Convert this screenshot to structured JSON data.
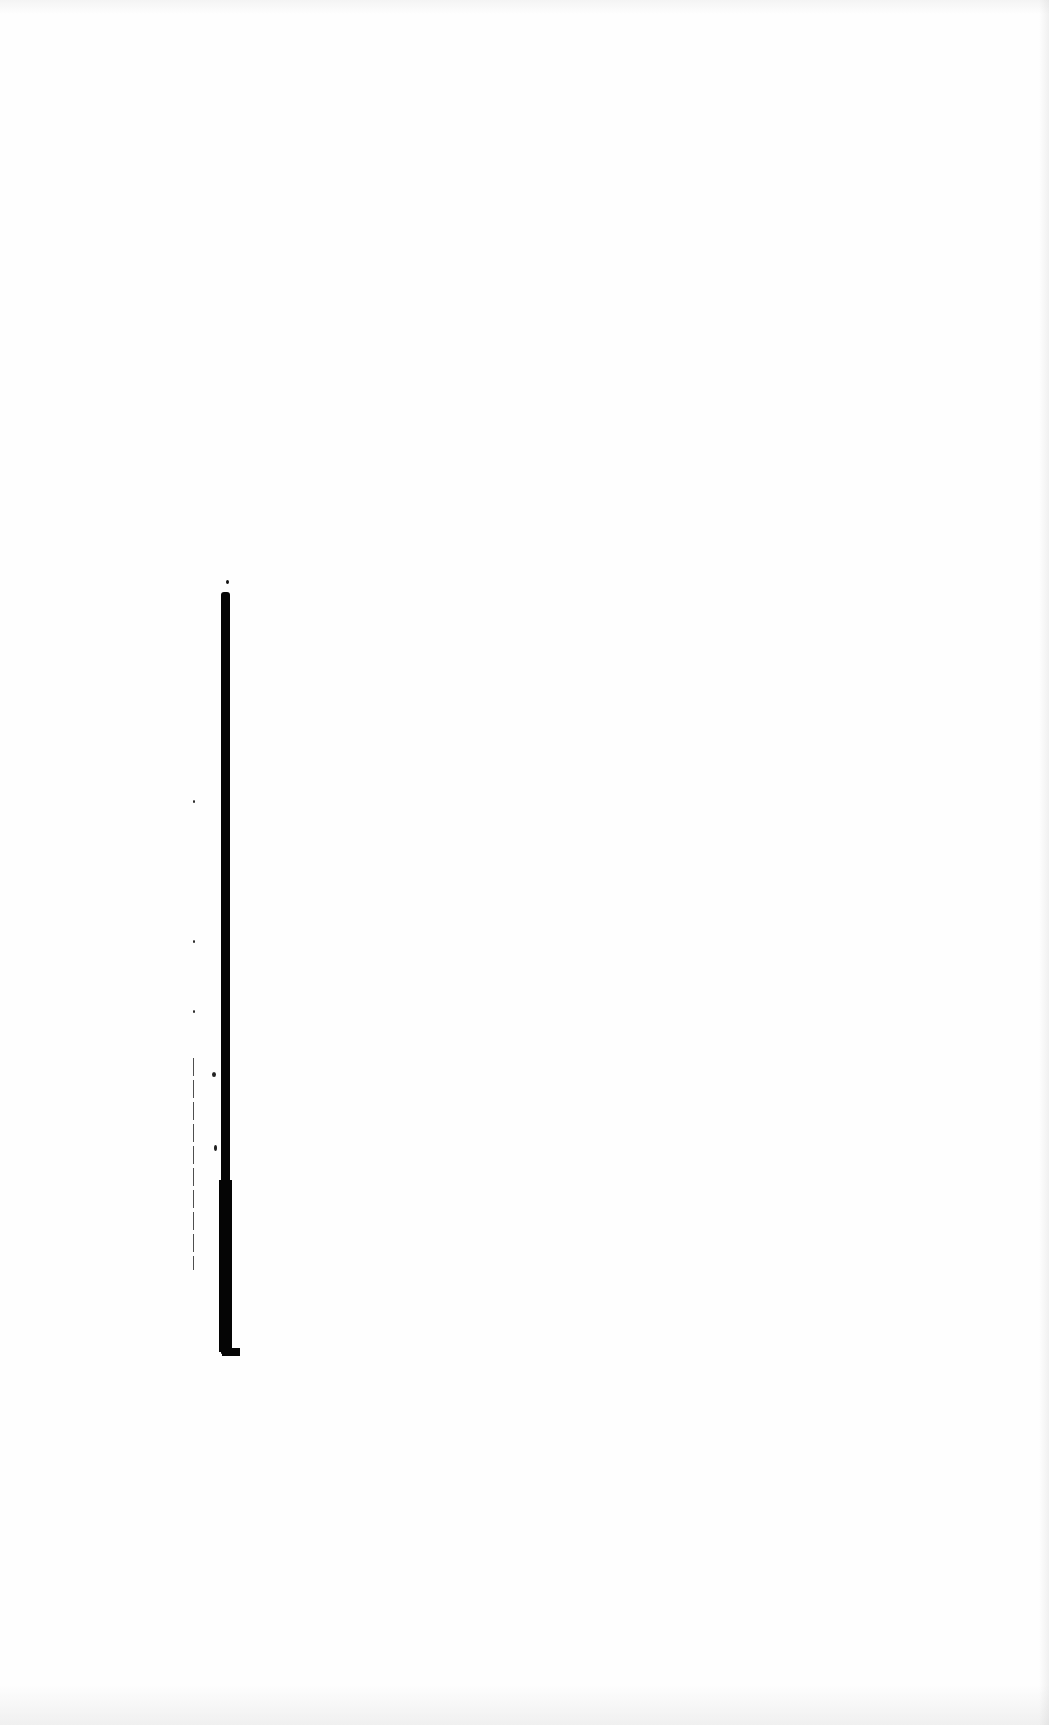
{
  "document": {
    "type": "scanned-page",
    "legible_text": "",
    "background_color": "#fefefe",
    "ink_color": "#050505"
  },
  "marks": {
    "binding_bar": {
      "description": "thick black vertical bar (binding edge / scan shadow)",
      "x": 221,
      "y_start": 592,
      "y_end": 1354
    },
    "thin_rule": {
      "description": "thin dashed vertical line left of bar",
      "x": 193,
      "y_start": 1058,
      "y_end": 1270
    },
    "specks": [
      {
        "x": 193,
        "y": 800
      },
      {
        "x": 193,
        "y": 940
      },
      {
        "x": 193,
        "y": 1010
      },
      {
        "x": 212,
        "y": 1072
      },
      {
        "x": 224,
        "y": 1120
      }
    ]
  }
}
